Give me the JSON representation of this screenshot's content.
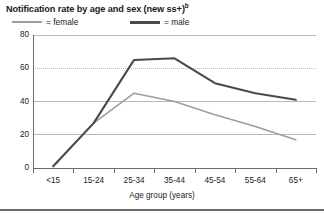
{
  "chart_data": {
    "type": "line",
    "title": "Notification rate by age and sex (new ss+)",
    "title_superscript": "b",
    "xlabel": "Age group (years)",
    "ylabel": "",
    "categories": [
      "<15",
      "15-24",
      "25-34",
      "35-44",
      "45-54",
      "55-64",
      "65+"
    ],
    "yticks": [
      0,
      20,
      40,
      60,
      80
    ],
    "ylim": [
      0,
      80
    ],
    "grid": true,
    "legend_position": "top-left",
    "series": [
      {
        "name": "female",
        "color": "#9d9d9d",
        "values": [
          1,
          27,
          45,
          40,
          32,
          25,
          17
        ]
      },
      {
        "name": "male",
        "color": "#4a4a4a",
        "values": [
          1,
          27,
          65,
          66,
          51,
          45,
          41
        ]
      }
    ]
  },
  "legend": {
    "female_label": "= female",
    "male_label": "= male"
  },
  "axes": {
    "y_labels": [
      "80",
      "60",
      "40",
      "20",
      "0"
    ],
    "x_labels": [
      "<15",
      "15-24",
      "25-34",
      "35-44",
      "45-54",
      "55-64",
      "65+"
    ],
    "x_axis_title": "Age group (years)"
  },
  "colors": {
    "female_line": "#9d9d9d",
    "male_line": "#4a4a4a",
    "grid": "#b9b9b9",
    "axis": "#6a6a6a",
    "text": "#1a1a1a",
    "background": "#ffffff"
  }
}
